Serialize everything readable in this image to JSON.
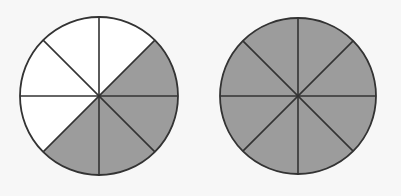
{
  "figure": {
    "width": 401,
    "height": 196,
    "background": "#f7f7f7",
    "stroke_color": "#333333",
    "shade_color": "#9c9c9c",
    "empty_color": "#ffffff"
  },
  "circles": [
    {
      "name": "left-fraction-circle",
      "cx": 99,
      "cy": 96,
      "r": 79,
      "sectors": 8,
      "shaded_sectors_deg": [
        [
          -45,
          0
        ],
        [
          0,
          45
        ],
        [
          -90,
          -45
        ],
        [
          -135,
          -90
        ]
      ],
      "shaded_count": 4,
      "fraction": "4/8"
    },
    {
      "name": "right-fraction-circle",
      "cx": 298,
      "cy": 96,
      "r": 78,
      "sectors": 8,
      "shaded_sectors_deg": [
        [
          0,
          45
        ],
        [
          45,
          90
        ],
        [
          90,
          135
        ],
        [
          135,
          180
        ],
        [
          180,
          225
        ],
        [
          225,
          270
        ],
        [
          270,
          315
        ],
        [
          315,
          360
        ]
      ],
      "shaded_count": 8,
      "fraction": "8/8"
    }
  ]
}
